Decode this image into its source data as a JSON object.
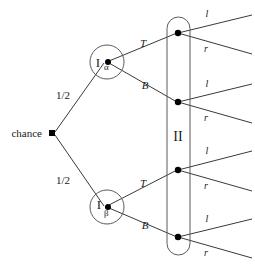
{
  "figure": {
    "type": "extensive-form-game-tree",
    "root": {
      "label": "chance",
      "x": 52,
      "y": 133
    },
    "chance_branches": [
      {
        "label": "1/2",
        "x": 63,
        "y": 96,
        "target": "I-alpha"
      },
      {
        "label": "1/2",
        "x": 63,
        "y": 181,
        "target": "I-beta"
      }
    ],
    "player_one_nodes": [
      {
        "id": "I-alpha",
        "label_main": "I",
        "label_sub": "α",
        "x": 107,
        "y": 62,
        "circle_r": 17
      },
      {
        "id": "I-beta",
        "label_main": "I",
        "label_sub": "β",
        "x": 107,
        "y": 207,
        "circle_r": 17
      }
    ],
    "player_one_actions": [
      {
        "label": "T",
        "x": 143,
        "y": 44,
        "from": "I-alpha"
      },
      {
        "label": "B",
        "x": 145,
        "y": 86,
        "from": "I-alpha"
      },
      {
        "label": "T",
        "x": 143,
        "y": 184,
        "from": "I-beta"
      },
      {
        "label": "B",
        "x": 145,
        "y": 226,
        "from": "I-beta"
      }
    ],
    "information_set": {
      "label": "II",
      "label_x": 178,
      "label_y": 136,
      "left": 167,
      "right": 190,
      "top": 17,
      "bottom": 255
    },
    "player_two_nodes": [
      {
        "id": "n1",
        "x": 178,
        "y": 33
      },
      {
        "id": "n2",
        "x": 178,
        "y": 102
      },
      {
        "id": "n3",
        "x": 178,
        "y": 170
      },
      {
        "id": "n4",
        "x": 178,
        "y": 237
      }
    ],
    "player_two_actions": [
      {
        "label": "l",
        "x": 207,
        "y": 14,
        "from": "n1"
      },
      {
        "label": "r",
        "x": 206,
        "y": 49,
        "from": "n1"
      },
      {
        "label": "l",
        "x": 207,
        "y": 84,
        "from": "n2"
      },
      {
        "label": "r",
        "x": 206,
        "y": 118,
        "from": "n2"
      },
      {
        "label": "l",
        "x": 207,
        "y": 151,
        "from": "n3"
      },
      {
        "label": "r",
        "x": 206,
        "y": 186,
        "from": "n3"
      },
      {
        "label": "l",
        "x": 207,
        "y": 219,
        "from": "n4"
      },
      {
        "label": "r",
        "x": 206,
        "y": 253,
        "from": "n4"
      }
    ],
    "colors": {
      "edge": "#3a3a3a",
      "outline": "#5a5a5a",
      "node": "#000000",
      "text": "#1a1a1a",
      "background": "#ffffff"
    }
  }
}
